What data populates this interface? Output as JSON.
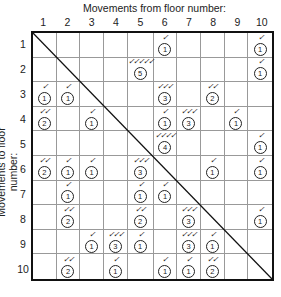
{
  "title_top": "Movements from floor number:",
  "title_side": "Movements to floor number:",
  "column_labels": [
    "1",
    "2",
    "3",
    "4",
    "5",
    "6",
    "7",
    "8",
    "9",
    "10"
  ],
  "row_labels": [
    "1",
    "2",
    "3",
    "4",
    "5",
    "6",
    "7",
    "8",
    "9",
    "10"
  ],
  "tick_glyph": "✓",
  "cells": [
    {
      "row": 1,
      "col": 6,
      "count": 1
    },
    {
      "row": 1,
      "col": 10,
      "count": 1
    },
    {
      "row": 2,
      "col": 5,
      "count": 5
    },
    {
      "row": 2,
      "col": 10,
      "count": 1
    },
    {
      "row": 3,
      "col": 1,
      "count": 1
    },
    {
      "row": 3,
      "col": 2,
      "count": 1
    },
    {
      "row": 3,
      "col": 6,
      "count": 3
    },
    {
      "row": 3,
      "col": 8,
      "count": 2
    },
    {
      "row": 4,
      "col": 1,
      "count": 2
    },
    {
      "row": 4,
      "col": 3,
      "count": 1
    },
    {
      "row": 4,
      "col": 6,
      "count": 1
    },
    {
      "row": 4,
      "col": 7,
      "count": 3
    },
    {
      "row": 4,
      "col": 9,
      "count": 1
    },
    {
      "row": 5,
      "col": 6,
      "count": 4
    },
    {
      "row": 5,
      "col": 10,
      "count": 1
    },
    {
      "row": 6,
      "col": 1,
      "count": 2
    },
    {
      "row": 6,
      "col": 2,
      "count": 1
    },
    {
      "row": 6,
      "col": 3,
      "count": 1
    },
    {
      "row": 6,
      "col": 5,
      "count": 3
    },
    {
      "row": 6,
      "col": 8,
      "count": 1
    },
    {
      "row": 6,
      "col": 10,
      "count": 1
    },
    {
      "row": 7,
      "col": 2,
      "count": 1
    },
    {
      "row": 7,
      "col": 5,
      "count": 1
    },
    {
      "row": 7,
      "col": 6,
      "count": 1
    },
    {
      "row": 8,
      "col": 2,
      "count": 2
    },
    {
      "row": 8,
      "col": 5,
      "count": 2
    },
    {
      "row": 8,
      "col": 7,
      "count": 3
    },
    {
      "row": 8,
      "col": 10,
      "count": 1
    },
    {
      "row": 9,
      "col": 3,
      "count": 1
    },
    {
      "row": 9,
      "col": 4,
      "count": 3
    },
    {
      "row": 9,
      "col": 5,
      "count": 1
    },
    {
      "row": 9,
      "col": 7,
      "count": 3
    },
    {
      "row": 9,
      "col": 8,
      "count": 1
    },
    {
      "row": 10,
      "col": 2,
      "count": 2
    },
    {
      "row": 10,
      "col": 4,
      "count": 1
    },
    {
      "row": 10,
      "col": 6,
      "count": 1
    },
    {
      "row": 10,
      "col": 7,
      "count": 1
    },
    {
      "row": 10,
      "col": 8,
      "count": 2
    }
  ]
}
